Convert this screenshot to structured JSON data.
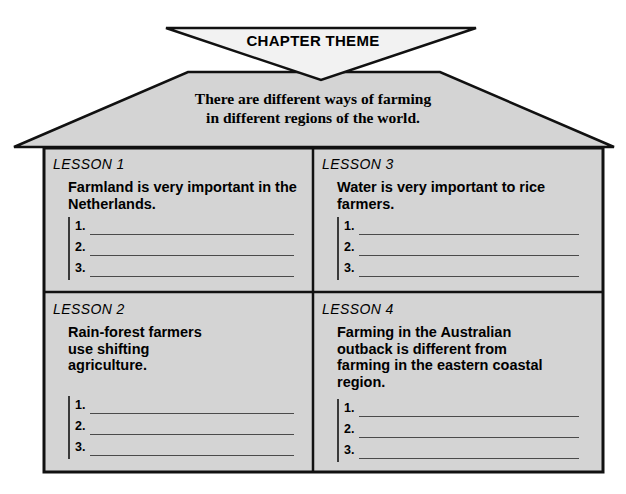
{
  "banner": {
    "title": "CHAPTER THEME"
  },
  "theme": {
    "line1": "There are different ways of farming",
    "line2": "in different regions of the world."
  },
  "colors": {
    "fill": "#d4d4d4",
    "banner_fill": "#f2f2f2",
    "outline": "#111111",
    "rule": "#4a4a4a"
  },
  "lessons": [
    {
      "label": "LESSON 1",
      "title": "Farmland is very important in the Netherlands.",
      "items": [
        "1.",
        "2.",
        "3."
      ]
    },
    {
      "label": "LESSON 3",
      "title": "Water is very important to rice farmers.",
      "items": [
        "1.",
        "2.",
        "3."
      ]
    },
    {
      "label": "LESSON 2",
      "title": "Rain-forest farmers use shifting agriculture.",
      "items": [
        "1.",
        "2.",
        "3."
      ]
    },
    {
      "label": "LESSON 4",
      "title": "Farming in the Australian outback is different from farming in the eastern coastal region.",
      "items": [
        "1.",
        "2.",
        "3."
      ]
    }
  ]
}
